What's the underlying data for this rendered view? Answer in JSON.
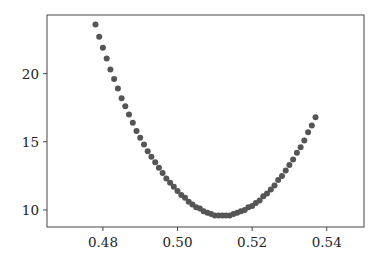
{
  "chart_data": {
    "type": "scatter",
    "title": "",
    "xlabel": "",
    "ylabel": "",
    "xlim": [
      0.465,
      0.55
    ],
    "ylim": [
      8.75,
      24.3
    ],
    "grid": false,
    "legend": null,
    "x_ticks": [
      0.48,
      0.5,
      0.52,
      0.54
    ],
    "x_tick_labels": [
      "0.48",
      "0.50",
      "0.52",
      "0.54"
    ],
    "y_ticks": [
      10,
      15,
      20
    ],
    "y_tick_labels": [
      "10",
      "15",
      "20"
    ],
    "marker_color": "#555555",
    "series": [
      {
        "name": "points",
        "x_start": 0.478,
        "x_end": 0.537,
        "x_step": 0.001,
        "minimum": {
          "x": 0.5095,
          "y": 9.55
        },
        "x": [
          0.478,
          0.479,
          0.48,
          0.481,
          0.482,
          0.483,
          0.484,
          0.485,
          0.486,
          0.487,
          0.488,
          0.489,
          0.49,
          0.491,
          0.492,
          0.493,
          0.494,
          0.495,
          0.496,
          0.497,
          0.498,
          0.499,
          0.5,
          0.501,
          0.502,
          0.503,
          0.504,
          0.505,
          0.506,
          0.507,
          0.508,
          0.509,
          0.51,
          0.511,
          0.512,
          0.513,
          0.514,
          0.515,
          0.516,
          0.517,
          0.518,
          0.519,
          0.52,
          0.521,
          0.522,
          0.523,
          0.524,
          0.525,
          0.526,
          0.527,
          0.528,
          0.529,
          0.53,
          0.531,
          0.532,
          0.533,
          0.534,
          0.535,
          0.536,
          0.537
        ],
        "y": [
          23.6,
          22.7,
          21.9,
          21.1,
          20.3,
          19.6,
          18.9,
          18.2,
          17.6,
          17.0,
          16.4,
          15.8,
          15.3,
          14.8,
          14.3,
          13.9,
          13.5,
          13.1,
          12.7,
          12.3,
          12.0,
          11.7,
          11.4,
          11.1,
          10.9,
          10.6,
          10.4,
          10.2,
          10.1,
          9.9,
          9.8,
          9.7,
          9.6,
          9.6,
          9.6,
          9.6,
          9.6,
          9.7,
          9.8,
          9.9,
          10.0,
          10.2,
          10.3,
          10.5,
          10.7,
          11.0,
          11.2,
          11.5,
          11.8,
          12.2,
          12.5,
          12.9,
          13.3,
          13.7,
          14.2,
          14.6,
          15.1,
          15.7,
          16.2,
          16.8
        ]
      }
    ]
  }
}
